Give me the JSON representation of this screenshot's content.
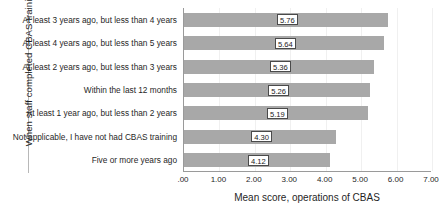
{
  "chart_data": {
    "type": "bar",
    "orientation": "horizontal",
    "title": "",
    "xlabel": "Mean score, operations of CBAS",
    "ylabel": "When staff completed CBAS training",
    "xlim": [
      0,
      7
    ],
    "grid": true,
    "legend": "none",
    "xticklabels": [
      ".00",
      "1.00",
      "2.00",
      "3.00",
      "4.00",
      "5.00",
      "6.00",
      "7.00"
    ],
    "xtickvalues": [
      0,
      1,
      2,
      3,
      4,
      5,
      6,
      7
    ],
    "categories": [
      "At least 3 years ago, but less than 4 years",
      "At least 4 years ago, but less than 5 years",
      "At least 2 years ago, but less than 3 years",
      "Within the last 12 months",
      "At least 1 year ago, but less than 2 years",
      "Not applicable, I have not had CBAS training",
      "Five or more years ago"
    ],
    "values": [
      5.76,
      5.64,
      5.36,
      5.26,
      5.19,
      4.3,
      4.12
    ],
    "datalabels": [
      "5.76",
      "5.64",
      "5.36",
      "5.26",
      "5.19",
      "4.30",
      "4.12"
    ],
    "bar_color": "#a8a8a8",
    "axis_color": "#9a9a9a",
    "gridline_color": "#f0f0f0",
    "label_box_border_color": "#4a4a4a",
    "label_box_fill_color": "#ffffff"
  }
}
